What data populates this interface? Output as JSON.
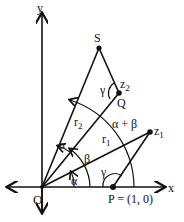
{
  "diagram": {
    "axes": {
      "x_label": "x",
      "y_label": "y",
      "origin_label": "O"
    },
    "points": {
      "S": "S",
      "Q": "Q",
      "z2": "z",
      "z2_sub": "2",
      "z1": "z",
      "z1_sub": "1",
      "P": "P = (1, 0)"
    },
    "segments": {
      "r1": "r",
      "r1_sub": "1",
      "r2": "r",
      "r2_sub": "2"
    },
    "angles": {
      "alpha_bottom": "α",
      "alpha_top": "α",
      "beta": "β",
      "alpha_plus_beta": "α + β",
      "gamma_at_Q": "γ",
      "gamma_at_P": "γ"
    },
    "colors": {
      "ink": "#111111",
      "background": "#ffffff"
    }
  }
}
